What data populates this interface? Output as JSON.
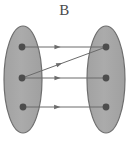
{
  "diagram": {
    "title": "B",
    "type": "set-mapping-diagram",
    "background_color": "#ffffff",
    "canvas": {
      "width": 129,
      "height": 143
    },
    "style": {
      "ellipse_fill": "#a8a8a8",
      "ellipse_stroke": "#6e6e6e",
      "ellipse_stroke_width": 1.2,
      "node_fill": "#4d4d4d",
      "node_radius": 3.4,
      "arrow_color": "#6b6b6b",
      "arrow_stroke_width": 1,
      "title_color": "#4a4a4a"
    },
    "sets": [
      {
        "id": "left-set",
        "name": "domain-set",
        "cx": 23,
        "cy": 79.5,
        "rx": 19,
        "ry": 53.5,
        "nodes": [
          {
            "id": "l1",
            "name": "left-node-1",
            "cx": 22,
            "cy": 47
          },
          {
            "id": "l2",
            "name": "left-node-2",
            "cx": 22,
            "cy": 78
          },
          {
            "id": "l3",
            "name": "left-node-3",
            "cx": 23,
            "cy": 107
          }
        ]
      },
      {
        "id": "right-set",
        "name": "codomain-set",
        "cx": 106,
        "cy": 79.5,
        "rx": 19,
        "ry": 53.5,
        "nodes": [
          {
            "id": "r1",
            "name": "right-node-1",
            "cx": 106,
            "cy": 47
          },
          {
            "id": "r2",
            "name": "right-node-2",
            "cx": 106,
            "cy": 78
          },
          {
            "id": "r3",
            "name": "right-node-3",
            "cx": 106,
            "cy": 107
          }
        ]
      }
    ],
    "arrows": [
      {
        "id": "a1",
        "name": "arrow-left1-to-right1",
        "from": "l1",
        "to": "r1",
        "x1": 22,
        "y1": 47,
        "x2": 106,
        "y2": 47,
        "head_t": 0.46
      },
      {
        "id": "a2",
        "name": "arrow-left2-to-right1",
        "from": "l2",
        "to": "r1",
        "x1": 22,
        "y1": 78,
        "x2": 106,
        "y2": 47,
        "head_t": 0.48
      },
      {
        "id": "a3",
        "name": "arrow-left2-to-right2",
        "from": "l2",
        "to": "r2",
        "x1": 22,
        "y1": 78,
        "x2": 106,
        "y2": 78,
        "head_t": 0.46
      },
      {
        "id": "a4",
        "name": "arrow-left3-to-right3",
        "from": "l3",
        "to": "r3",
        "x1": 23,
        "y1": 107,
        "x2": 106,
        "y2": 107,
        "head_t": 0.45
      }
    ]
  }
}
